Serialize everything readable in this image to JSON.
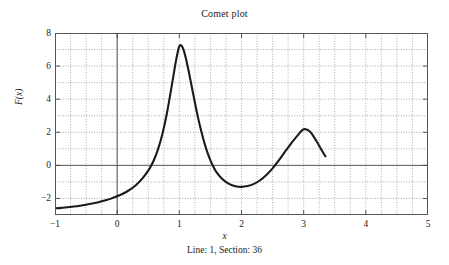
{
  "figure": {
    "title": "Comet plot",
    "caption": "Line: 1, Section: 36"
  },
  "axes": {
    "xlabel": "x",
    "ylabel": "F(x)",
    "xticks": [
      "-1",
      "0",
      "1",
      "2",
      "3",
      "4",
      "5"
    ],
    "yticks": [
      "8",
      "6",
      "4",
      "2",
      "0",
      "-2"
    ]
  },
  "colors": {
    "curve": "#1a1a1a",
    "axis": "#4d4d4d",
    "grid": "#808080",
    "background": "#ffffff",
    "text": "#222222"
  },
  "chart_data": {
    "type": "line",
    "title": "Comet plot",
    "subtitle": "Line: 1, Section: 36",
    "xlabel": "x",
    "ylabel": "F(x)",
    "xlim": [
      -1,
      5
    ],
    "ylim": [
      -3,
      8
    ],
    "xticks": [
      -1,
      0,
      1,
      2,
      3,
      4,
      5
    ],
    "yticks": [
      -2,
      0,
      2,
      4,
      6,
      8
    ],
    "x_minor_step": 0.25,
    "y_minor_step": 1,
    "grid": true,
    "grid_style": "dotted",
    "legend": null,
    "annotations": [
      {
        "text": "peak 1",
        "x": 1.0,
        "y": 7.2
      },
      {
        "text": "valley",
        "x": 2.0,
        "y": -1.3
      },
      {
        "text": "peak 2",
        "x": 3.0,
        "y": 2.2
      },
      {
        "text": "comet head (animation truncated)",
        "x": 3.35,
        "y": 0.55
      }
    ],
    "series": [
      {
        "name": "F(x)",
        "drawn_x_range": [
          -1,
          3.35
        ],
        "x": [
          -1.0,
          -0.9,
          -0.8,
          -0.7,
          -0.6,
          -0.5,
          -0.4,
          -0.3,
          -0.2,
          -0.1,
          0.0,
          0.1,
          0.2,
          0.3,
          0.4,
          0.5,
          0.55,
          0.6,
          0.65,
          0.7,
          0.75,
          0.8,
          0.85,
          0.9,
          0.95,
          1.0,
          1.05,
          1.1,
          1.15,
          1.2,
          1.25,
          1.3,
          1.35,
          1.4,
          1.45,
          1.5,
          1.55,
          1.6,
          1.7,
          1.8,
          1.9,
          2.0,
          2.1,
          2.2,
          2.3,
          2.4,
          2.5,
          2.6,
          2.7,
          2.8,
          2.9,
          3.0,
          3.1,
          3.2,
          3.3,
          3.35
        ],
        "y": [
          -2.6,
          -2.57,
          -2.53,
          -2.49,
          -2.44,
          -2.38,
          -2.31,
          -2.23,
          -2.13,
          -2.01,
          -1.87,
          -1.7,
          -1.48,
          -1.2,
          -0.82,
          -0.32,
          0.0,
          0.4,
          0.9,
          1.5,
          2.25,
          3.15,
          4.2,
          5.3,
          6.4,
          7.2,
          7.15,
          6.55,
          5.7,
          4.75,
          3.8,
          2.9,
          2.1,
          1.4,
          0.8,
          0.3,
          -0.1,
          -0.42,
          -0.86,
          -1.12,
          -1.26,
          -1.3,
          -1.25,
          -1.12,
          -0.9,
          -0.58,
          -0.18,
          0.3,
          0.83,
          1.33,
          1.8,
          2.18,
          2.05,
          1.5,
          0.85,
          0.55
        ]
      }
    ]
  }
}
